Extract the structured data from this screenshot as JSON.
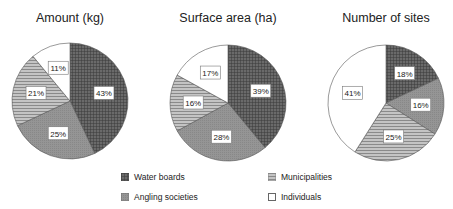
{
  "chart_data": [
    {
      "type": "pie",
      "title": "Amount (kg)",
      "categories": [
        "Water boards",
        "Angling societies",
        "Municipalities",
        "Individuals"
      ],
      "values": [
        43,
        25,
        21,
        11
      ],
      "labels": [
        "43%",
        "25%",
        "21%",
        "11%"
      ]
    },
    {
      "type": "pie",
      "title": "Surface area (ha)",
      "categories": [
        "Water boards",
        "Angling societies",
        "Municipalities",
        "Individuals"
      ],
      "values": [
        39,
        28,
        16,
        17
      ],
      "labels": [
        "39%",
        "28%",
        "16%",
        "17%"
      ]
    },
    {
      "type": "pie",
      "title": "Number of sites",
      "categories": [
        "Water boards",
        "Angling societies",
        "Municipalities",
        "Individuals"
      ],
      "values": [
        18,
        16,
        25,
        41
      ],
      "labels": [
        "18%",
        "16%",
        "25%",
        "41%"
      ]
    }
  ],
  "legend": [
    {
      "label": "Water boards",
      "pattern": "crosshatch-dark"
    },
    {
      "label": "Municipalities",
      "pattern": "horizontal-stripes"
    },
    {
      "label": "Angling societies",
      "pattern": "solid-gray"
    },
    {
      "label": "Individuals",
      "pattern": "white"
    }
  ],
  "colors": {
    "water_boards": "#5a5a5a",
    "angling_societies": "#8f8f8f",
    "municipalities": "#a8a8a8",
    "individuals": "#ffffff"
  }
}
